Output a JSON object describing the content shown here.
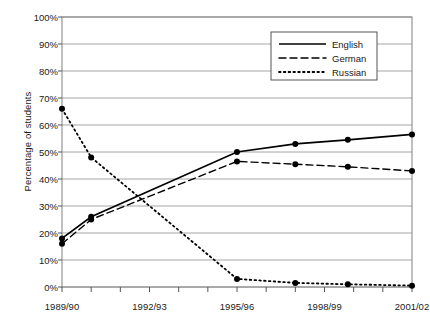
{
  "chart_data": {
    "type": "line",
    "title": "",
    "xlabel": "",
    "ylabel": "Percentage of students",
    "ylim": [
      0,
      100
    ],
    "ytick_labels": [
      "0%",
      "10%",
      "20%",
      "30%",
      "40%",
      "50%",
      "60%",
      "70%",
      "80%",
      "90%",
      "100%"
    ],
    "ytick_values": [
      0,
      10,
      20,
      30,
      40,
      50,
      60,
      70,
      80,
      90,
      100
    ],
    "grid": true,
    "legend_position": "top-right",
    "x": [
      "1989/90",
      "1990/91",
      "1991/92",
      "1992/93",
      "1993/94",
      "1994/95",
      "1995/96",
      "1996/97",
      "1997/98",
      "1998/99",
      "1999/00",
      "2000/01",
      "2001/02"
    ],
    "xtick_labels": [
      "1989/90",
      "1992/93",
      "1995/96",
      "1998/99",
      "2001/02"
    ],
    "xtick_indices": [
      0,
      3,
      6,
      9,
      12
    ],
    "series": [
      {
        "name": "English",
        "style": "solid",
        "color": "#000000",
        "points": [
          {
            "x": 0,
            "y": 18,
            "marker": true
          },
          {
            "x": 1,
            "y": 26,
            "marker": true
          },
          {
            "x": 6,
            "y": 50,
            "marker": true
          },
          {
            "x": 8,
            "y": 53,
            "marker": true
          },
          {
            "x": 9.8,
            "y": 54.5,
            "marker": true
          },
          {
            "x": 12,
            "y": 56.5,
            "marker": true
          }
        ]
      },
      {
        "name": "German",
        "style": "dashed",
        "color": "#000000",
        "points": [
          {
            "x": 0,
            "y": 16,
            "marker": true
          },
          {
            "x": 1,
            "y": 25,
            "marker": true
          },
          {
            "x": 6,
            "y": 46.5,
            "marker": true
          },
          {
            "x": 8,
            "y": 45.5,
            "marker": true
          },
          {
            "x": 9.8,
            "y": 44.5,
            "marker": true
          },
          {
            "x": 12,
            "y": 43,
            "marker": true
          }
        ]
      },
      {
        "name": "Russian",
        "style": "dotted",
        "color": "#000000",
        "points": [
          {
            "x": 0,
            "y": 66,
            "marker": true
          },
          {
            "x": 1,
            "y": 48,
            "marker": true
          },
          {
            "x": 6,
            "y": 3,
            "marker": true
          },
          {
            "x": 8,
            "y": 1.5,
            "marker": true
          },
          {
            "x": 9.8,
            "y": 1,
            "marker": true
          },
          {
            "x": 12,
            "y": 0.5,
            "marker": true
          }
        ]
      }
    ],
    "legend": [
      {
        "label": "English",
        "style": "solid"
      },
      {
        "label": "German",
        "style": "dashed"
      },
      {
        "label": "Russian",
        "style": "dotted"
      }
    ]
  }
}
